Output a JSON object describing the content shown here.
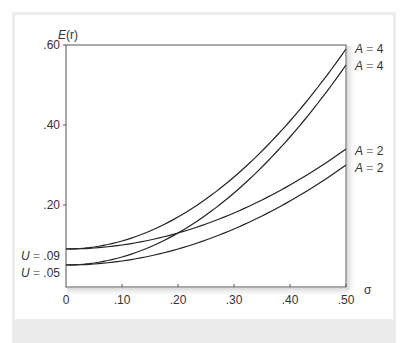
{
  "chart_data": {
    "type": "line",
    "title": "",
    "xlabel": "σ",
    "ylabel": "E(r)",
    "xlim": [
      0,
      0.5
    ],
    "ylim": [
      0,
      0.6
    ],
    "grid": false,
    "x_ticks": [
      "0",
      ".10",
      ".20",
      ".30",
      ".40",
      ".50"
    ],
    "y_ticks": [
      ".20",
      ".40",
      ".60"
    ],
    "formula": "E(r) = U + 0.5 * A * σ^2",
    "x": [
      0,
      0.05,
      0.1,
      0.15,
      0.2,
      0.25,
      0.3,
      0.35,
      0.4,
      0.45,
      0.5
    ],
    "series": [
      {
        "name": "U = .09, A = 4",
        "U": 0.09,
        "A": 4,
        "values": [
          0.09,
          0.095,
          0.11,
          0.135,
          0.17,
          0.215,
          0.27,
          0.335,
          0.41,
          0.495,
          0.59
        ]
      },
      {
        "name": "U = .05, A = 4",
        "U": 0.05,
        "A": 4,
        "values": [
          0.05,
          0.055,
          0.07,
          0.095,
          0.13,
          0.175,
          0.23,
          0.295,
          0.37,
          0.455,
          0.55
        ]
      },
      {
        "name": "U = .09, A = 2",
        "U": 0.09,
        "A": 2,
        "values": [
          0.09,
          0.0925,
          0.1,
          0.1125,
          0.13,
          0.1525,
          0.18,
          0.2125,
          0.25,
          0.2925,
          0.34
        ]
      },
      {
        "name": "U = .05, A = 2",
        "U": 0.05,
        "A": 2,
        "values": [
          0.05,
          0.0525,
          0.06,
          0.0725,
          0.09,
          0.1125,
          0.14,
          0.1725,
          0.21,
          0.2525,
          0.3
        ]
      }
    ],
    "annotations": {
      "left": [
        {
          "var": "U",
          "eq": " = ",
          "val": ".09"
        },
        {
          "var": "U",
          "eq": " = ",
          "val": ".05"
        }
      ],
      "right": [
        {
          "var": "A",
          "eq": " = ",
          "val": "4"
        },
        {
          "var": "A",
          "eq": " = ",
          "val": "4"
        },
        {
          "var": "A",
          "eq": " = ",
          "val": "2"
        },
        {
          "var": "A",
          "eq": " = ",
          "val": "2"
        }
      ]
    }
  },
  "axis": {
    "y_title_var": "E",
    "y_title_arg": "(r)",
    "x_title": "σ",
    "x_ticks": [
      "0",
      ".10",
      ".20",
      ".30",
      ".40",
      ".50"
    ],
    "y_ticks": [
      ".20",
      ".40",
      ".60"
    ]
  }
}
